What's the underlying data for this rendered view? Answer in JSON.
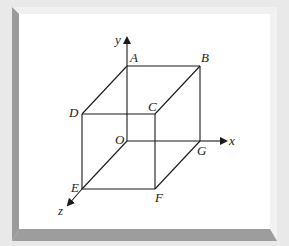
{
  "diagram": {
    "type": "3d-cube-coordinate-axes",
    "colors": {
      "background": "#e9e9e9",
      "panel": "#ffffff",
      "bevel_dark": "#9a9a9a",
      "bevel_light": "#f4f4f4",
      "line": "#1a1a1a"
    },
    "axes": {
      "x": {
        "label": "x"
      },
      "y": {
        "label": "y"
      },
      "z": {
        "label": "z"
      }
    },
    "vertices": {
      "A": "A",
      "B": "B",
      "C": "C",
      "D": "D",
      "O": "O",
      "E": "E",
      "F": "F",
      "G": "G"
    },
    "edges": [
      "AB",
      "BC",
      "CD",
      "DA",
      "OG",
      "GF",
      "FE",
      "EO",
      "AO",
      "BG",
      "CF",
      "DE"
    ]
  }
}
